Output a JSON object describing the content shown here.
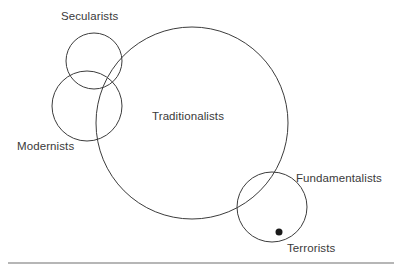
{
  "figure": {
    "width": 407,
    "height": 272,
    "background_color": "#ffffff",
    "stroke_color": "#3c3c3c",
    "text_color": "#3a3a3a",
    "marker_color": "#1a1a1a",
    "rule_color": "#6e6e6e"
  },
  "chart_data": {
    "type": "diagram",
    "subtype": "euler-venn",
    "title": "",
    "sets": [
      {
        "id": "secularists",
        "label": "Secularists",
        "cx": 94,
        "cy": 61,
        "r": 28,
        "label_x": 61,
        "label_y": 9,
        "label_position": "above"
      },
      {
        "id": "modernists",
        "label": "Modernists",
        "cx": 87,
        "cy": 106,
        "r": 35,
        "label_x": 17,
        "label_y": 139,
        "label_position": "below-left"
      },
      {
        "id": "traditionalists",
        "label": "Traditionalists",
        "cx": 192,
        "cy": 123,
        "r": 96,
        "label_x": 152,
        "label_y": 109,
        "label_position": "inside-center"
      },
      {
        "id": "fundamentalists",
        "label": "Fundamentalists",
        "cx": 272,
        "cy": 207,
        "r": 35,
        "label_x": 296,
        "label_y": 171,
        "label_position": "right"
      }
    ],
    "points": [
      {
        "id": "terrorists",
        "label": "Terrorists",
        "x": 279,
        "y": 232,
        "r": 3.5,
        "label_x": 287,
        "label_y": 241,
        "label_position": "below-right",
        "within": "fundamentalists"
      }
    ],
    "overlaps": [
      [
        "secularists",
        "modernists"
      ],
      [
        "secularists",
        "traditionalists"
      ],
      [
        "modernists",
        "traditionalists"
      ],
      [
        "traditionalists",
        "fundamentalists"
      ]
    ],
    "rule": {
      "x1": 8,
      "x2": 394,
      "y": 263
    }
  },
  "labels": {
    "secularists": "Secularists",
    "modernists": "Modernists",
    "traditionalists": "Traditionalists",
    "fundamentalists": "Fundamentalists",
    "terrorists": "Terrorists"
  }
}
